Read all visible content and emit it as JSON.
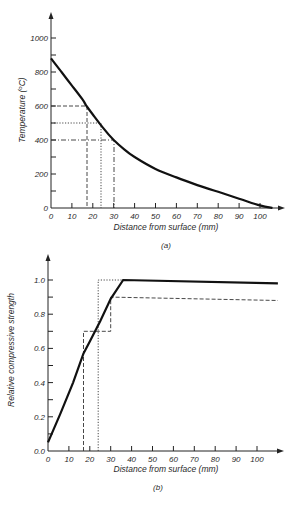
{
  "chart_data": [
    {
      "id": "a",
      "type": "line",
      "panel_label": "(a)",
      "title": "",
      "xlabel": "Distance from surface (mm)",
      "ylabel": "Temperature (°C)",
      "xlim": [
        0,
        110
      ],
      "ylim": [
        0,
        1100
      ],
      "xticks": [
        0,
        10,
        20,
        30,
        40,
        50,
        60,
        70,
        80,
        90,
        100
      ],
      "yticks_labeled": [
        0,
        200,
        400,
        600,
        800,
        1000
      ],
      "yticks_minor": [
        100,
        300,
        500,
        700,
        900
      ],
      "grid": false,
      "series": [
        {
          "name": "temperature profile",
          "style": "solid-thick",
          "x": [
            0,
            5,
            10,
            15,
            17,
            20,
            25,
            30,
            35,
            40,
            50,
            60,
            70,
            80,
            90,
            100,
            106
          ],
          "y": [
            880,
            800,
            720,
            640,
            600,
            550,
            470,
            400,
            345,
            300,
            230,
            180,
            135,
            95,
            55,
            15,
            0
          ]
        }
      ],
      "reference_lines": [
        {
          "style": "dashed",
          "temperature": 600,
          "distance": 17
        },
        {
          "style": "dotted",
          "temperature": 500,
          "distance": 24
        },
        {
          "style": "dash-dot",
          "temperature": 400,
          "distance": 30
        }
      ]
    },
    {
      "id": "b",
      "type": "line",
      "panel_label": "(b)",
      "title": "",
      "xlabel": "Distance from surface (mm)",
      "ylabel": "Relative compressive strength",
      "xlim": [
        0,
        110
      ],
      "ylim": [
        0,
        1.1
      ],
      "xticks": [
        0,
        10,
        20,
        30,
        40,
        50,
        60,
        70,
        80,
        90,
        100
      ],
      "yticks_labeled": [
        0.0,
        0.2,
        0.4,
        0.6,
        0.8,
        1.0
      ],
      "yticks_minor": [
        0.1,
        0.3,
        0.5,
        0.7,
        0.9
      ],
      "grid": false,
      "series": [
        {
          "name": "continuous strength",
          "style": "solid-thick",
          "x": [
            0,
            6,
            12,
            17,
            20,
            25,
            30,
            36,
            110
          ],
          "y": [
            0.05,
            0.22,
            0.4,
            0.57,
            0.64,
            0.76,
            0.89,
            1.0,
            0.98
          ]
        },
        {
          "name": "stepped (dashed)",
          "style": "dashed",
          "x": [
            17,
            17,
            30,
            30,
            110
          ],
          "y": [
            0.0,
            0.7,
            0.7,
            0.9,
            0.88
          ]
        },
        {
          "name": "stepped (dotted)",
          "style": "dotted",
          "x": [
            24,
            24,
            36
          ],
          "y": [
            0.0,
            1.0,
            1.0
          ]
        }
      ]
    }
  ],
  "labels": {
    "a": {
      "panel": "(a)",
      "xlabel": "Distance from surface (mm)",
      "ylabel": "Temperature (°C)",
      "xticks": [
        "0",
        "10",
        "20",
        "30",
        "40",
        "50",
        "60",
        "70",
        "80",
        "90",
        "100"
      ],
      "yticks": [
        "0",
        "200",
        "400",
        "600",
        "800",
        "1000"
      ]
    },
    "b": {
      "panel": "(b)",
      "xlabel": "Distance from surface (mm)",
      "ylabel": "Relative compressive strength",
      "xticks": [
        "0",
        "10",
        "20",
        "30",
        "40",
        "50",
        "60",
        "70",
        "80",
        "90",
        "100"
      ],
      "yticks": [
        "0.0",
        "0.2",
        "0.4",
        "0.6",
        "0.8",
        "1.0"
      ]
    }
  }
}
